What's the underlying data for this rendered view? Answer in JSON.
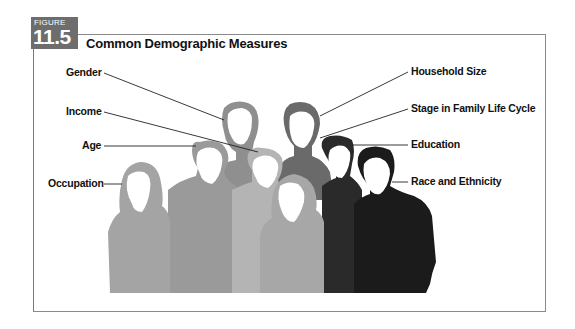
{
  "figure": {
    "tag_word": "FIGURE",
    "number": "11.5",
    "title": "Common Demographic Measures",
    "colors": {
      "tag_background": "#6d6d6d",
      "frame_border": "#8a8a8a",
      "text": "#111111"
    }
  },
  "labels": {
    "left": [
      {
        "id": "gender",
        "text": "Gender"
      },
      {
        "id": "income",
        "text": "Income"
      },
      {
        "id": "age",
        "text": "Age"
      },
      {
        "id": "occupation",
        "text": "Occupation"
      }
    ],
    "right": [
      {
        "id": "household-size",
        "text": "Household Size"
      },
      {
        "id": "stage-in-family-life-cycle",
        "text": "Stage in Family Life Cycle"
      },
      {
        "id": "education",
        "text": "Education"
      },
      {
        "id": "race-and-ethnicity",
        "text": "Race and Ethnicity"
      }
    ]
  },
  "people": [
    {
      "id": "gender-person",
      "position": "back-left",
      "color": "#8f8f8f"
    },
    {
      "id": "household-size-person",
      "position": "back-right",
      "color": "#6a6a6a"
    },
    {
      "id": "age-person",
      "position": "middle-left",
      "color": "#9a9a9a"
    },
    {
      "id": "income-person",
      "position": "center",
      "color": "#b4b4b4"
    },
    {
      "id": "education-person",
      "position": "middle-right",
      "color": "#2a2a2a"
    },
    {
      "id": "occupation-person",
      "position": "front-left",
      "color": "#a4a4a4"
    },
    {
      "id": "stage-person",
      "position": "front-center",
      "color": "#a7a7a7"
    },
    {
      "id": "race-person",
      "position": "front-right",
      "color": "#1b1b1b"
    }
  ]
}
